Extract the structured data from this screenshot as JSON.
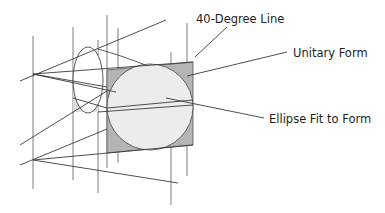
{
  "diagram": {
    "labels": {
      "forty_degree_line": "40-Degree Line",
      "unitary_form": "Unitary Form",
      "ellipse_fit": "Ellipse Fit to Form"
    },
    "colors": {
      "line": "#444444",
      "square_fill": "#b4b4b4",
      "circle_fill": "#ececec",
      "ellipse_fill": "#e2e2e2",
      "text": "#1e1e1e"
    }
  }
}
